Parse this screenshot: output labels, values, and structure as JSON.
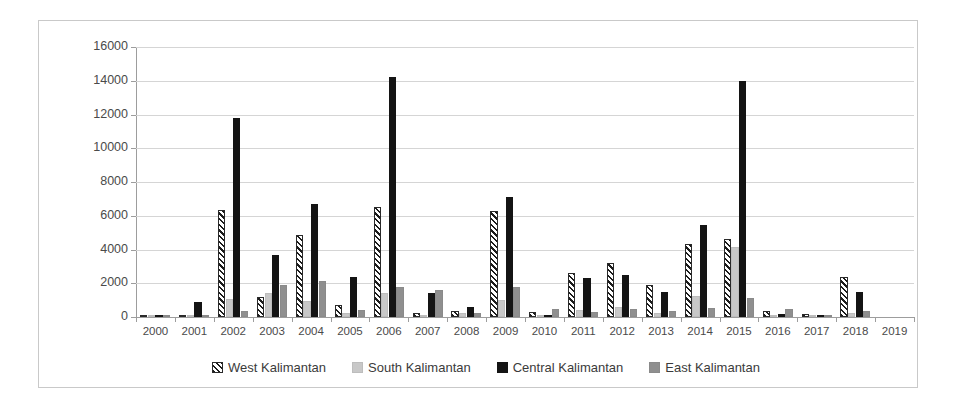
{
  "chart_data": {
    "type": "bar",
    "title": "",
    "xlabel": "",
    "ylabel": "Hotspot number",
    "ylim": [
      0,
      16000
    ],
    "ytick_step": 2000,
    "yticks": [
      0,
      2000,
      4000,
      6000,
      8000,
      10000,
      12000,
      14000,
      16000
    ],
    "grid": true,
    "grid_axis": "y",
    "legend_position": "bottom-center",
    "categories": [
      "2000",
      "2001",
      "2002",
      "2003",
      "2004",
      "2005",
      "2006",
      "2007",
      "2008",
      "2009",
      "2010",
      "2011",
      "2012",
      "2013",
      "2014",
      "2015",
      "2016",
      "2017",
      "2018",
      "2019"
    ],
    "series": [
      {
        "name": "West Kalimantan",
        "pattern": "diagonal-hatch",
        "color": "#ffffff",
        "values": [
          20,
          120,
          6350,
          1200,
          4850,
          700,
          6500,
          260,
          330,
          6300,
          300,
          2600,
          3200,
          1900,
          4350,
          4600,
          330,
          180,
          2350,
          0
        ]
      },
      {
        "name": "South Kalimantan",
        "pattern": "solid",
        "color": "#c8c8c8",
        "values": [
          30,
          60,
          1050,
          1400,
          950,
          260,
          1450,
          130,
          220,
          1000,
          80,
          420,
          600,
          260,
          1250,
          4150,
          100,
          60,
          260,
          0
        ]
      },
      {
        "name": "Central Kalimantan",
        "pattern": "solid",
        "color": "#141414",
        "values": [
          40,
          900,
          11800,
          3650,
          6700,
          2400,
          14200,
          1400,
          600,
          7100,
          130,
          2300,
          2500,
          1500,
          5450,
          14000,
          180,
          90,
          1500,
          0
        ]
      },
      {
        "name": "East Kalimantan",
        "pattern": "solid",
        "color": "#8f8f8f",
        "values": [
          60,
          100,
          380,
          1900,
          2150,
          430,
          1800,
          1600,
          250,
          1800,
          450,
          300,
          500,
          330,
          550,
          1100,
          500,
          130,
          380,
          0
        ]
      }
    ]
  },
  "legend": {
    "items": [
      {
        "label": "West Kalimantan",
        "key": "west"
      },
      {
        "label": "South Kalimantan",
        "key": "south"
      },
      {
        "label": "Central Kalimantan",
        "key": "central"
      },
      {
        "label": "East Kalimantan",
        "key": "east"
      }
    ]
  }
}
